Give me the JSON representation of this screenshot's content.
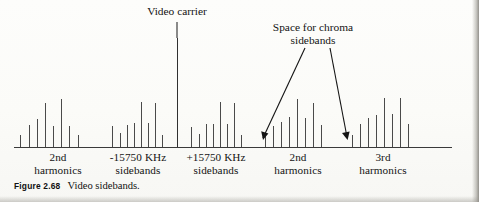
{
  "figure": {
    "number": "Figure 2.68",
    "caption": "Video sidebands."
  },
  "annotations": [
    {
      "name": "video-carrier",
      "lines": [
        "Video carrier"
      ],
      "x": 177,
      "y": 6,
      "width": 120
    },
    {
      "name": "space-for-chroma-sidebands",
      "lines": [
        "Space for chroma",
        "sidebands"
      ],
      "x": 313,
      "y": 22,
      "width": 150
    }
  ],
  "group_labels": [
    {
      "name": "2nd-harmonics-left",
      "lines": [
        "2nd",
        "harmonics"
      ],
      "x": 58,
      "y": 151
    },
    {
      "name": "minus-15750-khz-sidebands",
      "lines": [
        "-15750 KHz",
        "sidebands"
      ],
      "x": 138,
      "y": 151
    },
    {
      "name": "plus-15750-khz-sidebands",
      "lines": [
        "+15750 KHz",
        "sidebands"
      ],
      "x": 216,
      "y": 151
    },
    {
      "name": "2nd-harmonics-right",
      "lines": [
        "2nd",
        "harmonics"
      ],
      "x": 298,
      "y": 151
    },
    {
      "name": "3rd-harmonics",
      "lines": [
        "3rd",
        "harmonics"
      ],
      "x": 383,
      "y": 151
    }
  ],
  "chart_data": {
    "type": "bar",
    "title": "Video sidebands",
    "xlabel": "",
    "ylabel": "",
    "grid": false,
    "legend": null,
    "axis": {
      "baseline_y": 147,
      "x_start": 14,
      "x_end": 452
    },
    "categories": [
      "2nd harmonics",
      "-15750 KHz sidebands",
      "Video carrier",
      "+15750 KHz sidebands",
      "2nd harmonics",
      "3rd harmonics"
    ],
    "groups": [
      {
        "name": "2nd harmonics",
        "x": [
          20,
          29,
          37,
          45,
          53,
          61,
          69,
          78
        ],
        "values": [
          13,
          23,
          29,
          45,
          22,
          49,
          22,
          13
        ]
      },
      {
        "name": "-15750 KHz sidebands",
        "x": [
          112,
          120,
          127,
          134,
          141,
          148,
          155,
          162
        ],
        "values": [
          22,
          15,
          23,
          25,
          46,
          25,
          45,
          13
        ]
      },
      {
        "name": "video carrier",
        "x": [
          177
        ],
        "values": [
          110
        ]
      },
      {
        "name": "+15750 KHz sidebands",
        "x": [
          191,
          199,
          206,
          213,
          220,
          227,
          234,
          241
        ],
        "values": [
          21,
          14,
          24,
          24,
          46,
          24,
          45,
          13
        ]
      },
      {
        "name": "2nd harmonics",
        "x": [
          265,
          273,
          281,
          289,
          297,
          305,
          313,
          321
        ],
        "values": [
          13,
          22,
          26,
          31,
          49,
          30,
          45,
          23
        ]
      },
      {
        "name": "3rd harmonics",
        "x": [
          352,
          360,
          368,
          376,
          384,
          392,
          400,
          408
        ],
        "values": [
          13,
          24,
          30,
          33,
          50,
          34,
          50,
          24
        ]
      }
    ]
  },
  "colors": {
    "ink": "#161616",
    "spike": "#4a4a4a",
    "baseline": "#3a3a3a",
    "paper": "#fdfdfb"
  }
}
